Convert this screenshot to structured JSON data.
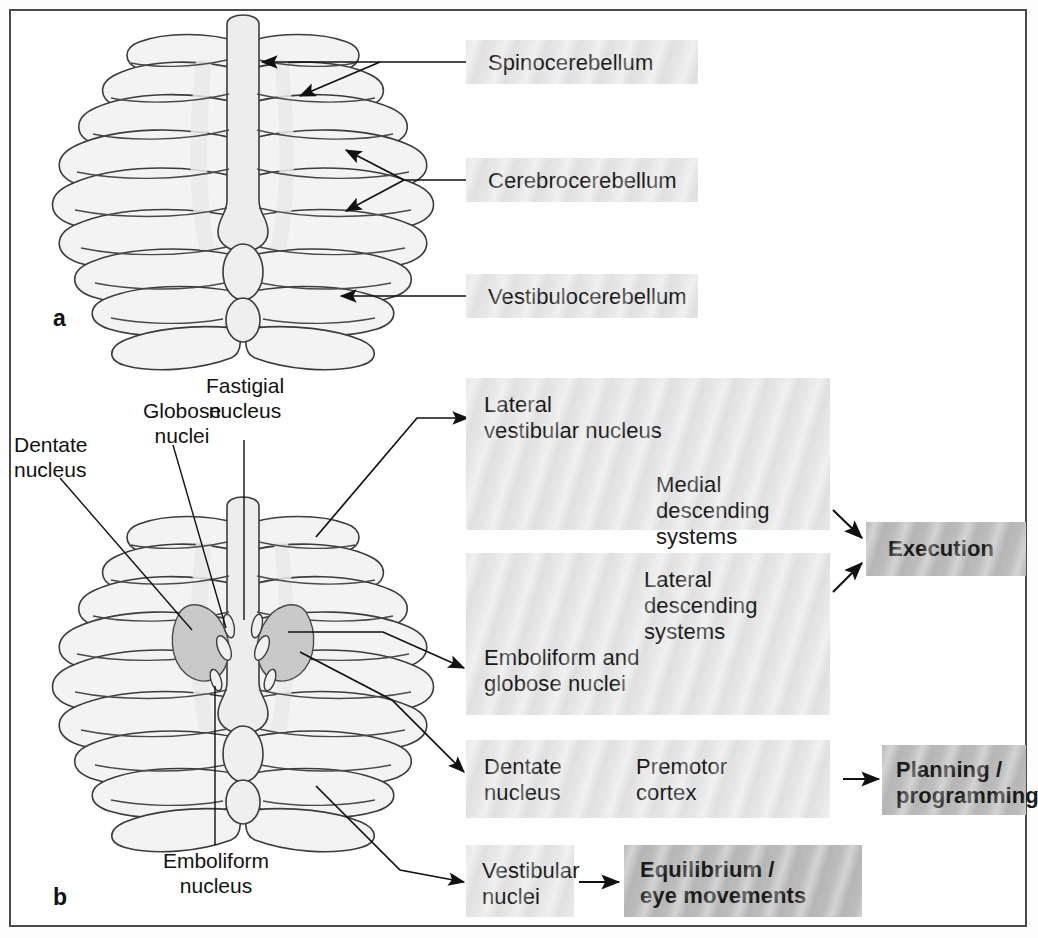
{
  "figure": {
    "panel_a": {
      "letter": "a",
      "labels": [
        {
          "id": "spinocerebellum",
          "text": "Spinocerebellum"
        },
        {
          "id": "cerebrocerebellum",
          "text": "Cerebrocerebellum"
        },
        {
          "id": "vestibulocerebellum",
          "text": "Vestibulocerebellum"
        }
      ]
    },
    "panel_b": {
      "letter": "b",
      "nuclei_labels": [
        {
          "id": "dentate-nucleus",
          "text": "Dentate\nnucleus"
        },
        {
          "id": "globose-nuclei",
          "text": "Globose\nnuclei"
        },
        {
          "id": "fastigial-nucleus",
          "text": "Fastigial\nnucleus"
        },
        {
          "id": "emboliform-nucleus",
          "text": "Emboliform\nnucleus"
        }
      ],
      "pathways": [
        {
          "id": "pathway-lateral-vestibular",
          "source": "Lateral\nvestibular nucleus",
          "target": "Medial descending\nsystems",
          "outcome": "Execution"
        },
        {
          "id": "pathway-emboliform-globose",
          "source": "Emboliform and\nglobose nuclei",
          "target": "Lateral descending\nsystems",
          "outcome": "Execution"
        },
        {
          "id": "pathway-dentate",
          "source": "Dentate\nnucleus",
          "target": "Premotor\ncortex",
          "outcome": "Planning /\nprogramming"
        },
        {
          "id": "pathway-vestibular",
          "source": "Vestibular\nnuclei",
          "target": "",
          "outcome": "Equilibrium /\neye movements"
        }
      ],
      "outcomes": [
        {
          "id": "execution",
          "text": "Execution"
        },
        {
          "id": "planning-programming",
          "text": "Planning /\nprogramming"
        },
        {
          "id": "equilibrium-eye-movements",
          "text": "Equilibrium /\neye movements"
        }
      ]
    },
    "colors": {
      "frame_border": "#4a4a4a",
      "box_light": "#e8e8e8",
      "box_dark": "#bcbcbc",
      "outline": "#3c3c3c",
      "cerebellum_fill": "#f2f2f2",
      "vermis_fill": "#ececec",
      "dentate_fill": "#c9c9c9",
      "text": "#121212"
    }
  }
}
